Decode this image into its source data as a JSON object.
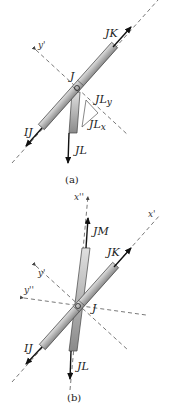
{
  "diagram_a": {
    "caption": "(a)",
    "joint_label": "J",
    "forces": {
      "jk": "JK",
      "ij": "IJ",
      "jl": "JL"
    },
    "components": {
      "jl_y": "JL",
      "jl_y_sub": "y",
      "jl_x": "JL",
      "jl_x_sub": "x"
    },
    "axes": {
      "y_prime": "y'"
    }
  },
  "diagram_b": {
    "caption": "(b)",
    "joint_label": "J",
    "forces": {
      "jm": "JM",
      "jk": "JK",
      "ij": "IJ",
      "jl": "JL"
    },
    "axes": {
      "x_double_prime": "x''",
      "x_prime": "x'",
      "y_prime": "y'",
      "y_double_prime": "y''"
    }
  },
  "colors": {
    "member_fill": "#bdbdbd",
    "member_stroke": "#444444",
    "arrow": "#111111",
    "dash": "#555555"
  }
}
